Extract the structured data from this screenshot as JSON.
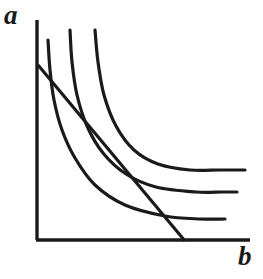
{
  "figure": {
    "title": "",
    "width": 263,
    "height": 279,
    "background_color": "#ffffff",
    "ink_color": "#1a1a1a"
  },
  "axes": {
    "y_label": "a",
    "x_label": "b",
    "origin": {
      "x": 37,
      "y": 240
    },
    "y_axis_top": {
      "x": 37,
      "y": 20
    },
    "x_axis_right": {
      "x": 250,
      "y": 240
    },
    "stroke_width": 3.2,
    "ticks": [],
    "gridlines": false
  },
  "chart_data": {
    "type": "line",
    "title": "",
    "xlabel": "b",
    "ylabel": "a",
    "xlim": [
      0,
      1
    ],
    "ylim": [
      0,
      1
    ],
    "grid": false,
    "legend": "none",
    "series": [
      {
        "name": "indifference-curve-1",
        "kind": "indifference-curve",
        "stroke": "#1a1a1a",
        "stroke_width": 3.2,
        "path_points": [
          [
            48,
            40
          ],
          [
            50,
            70
          ],
          [
            54,
            100
          ],
          [
            62,
            130
          ],
          [
            75,
            158
          ],
          [
            95,
            185
          ],
          [
            125,
            205
          ],
          [
            165,
            216
          ],
          [
            200,
            219
          ],
          [
            225,
            219
          ]
        ]
      },
      {
        "name": "indifference-curve-2",
        "kind": "indifference-curve",
        "stroke": "#1a1a1a",
        "stroke_width": 3.2,
        "path_points": [
          [
            70,
            30
          ],
          [
            72,
            62
          ],
          [
            77,
            95
          ],
          [
            87,
            126
          ],
          [
            103,
            153
          ],
          [
            126,
            174
          ],
          [
            156,
            187
          ],
          [
            196,
            192
          ],
          [
            222,
            192
          ],
          [
            237,
            192
          ]
        ]
      },
      {
        "name": "indifference-curve-3",
        "kind": "indifference-curve",
        "stroke": "#1a1a1a",
        "stroke_width": 3.2,
        "path_points": [
          [
            95,
            30
          ],
          [
            98,
            62
          ],
          [
            104,
            95
          ],
          [
            116,
            126
          ],
          [
            134,
            150
          ],
          [
            158,
            164
          ],
          [
            190,
            170
          ],
          [
            220,
            170
          ],
          [
            245,
            170
          ]
        ]
      },
      {
        "name": "budget-line",
        "kind": "straight-line",
        "stroke": "#1a1a1a",
        "stroke_width": 3.2,
        "path_points": [
          [
            38,
            65
          ],
          [
            185,
            241
          ]
        ]
      }
    ],
    "annotations": [
      {
        "name": "tangency-point",
        "x": 120,
        "y": 156,
        "label": ""
      }
    ]
  }
}
